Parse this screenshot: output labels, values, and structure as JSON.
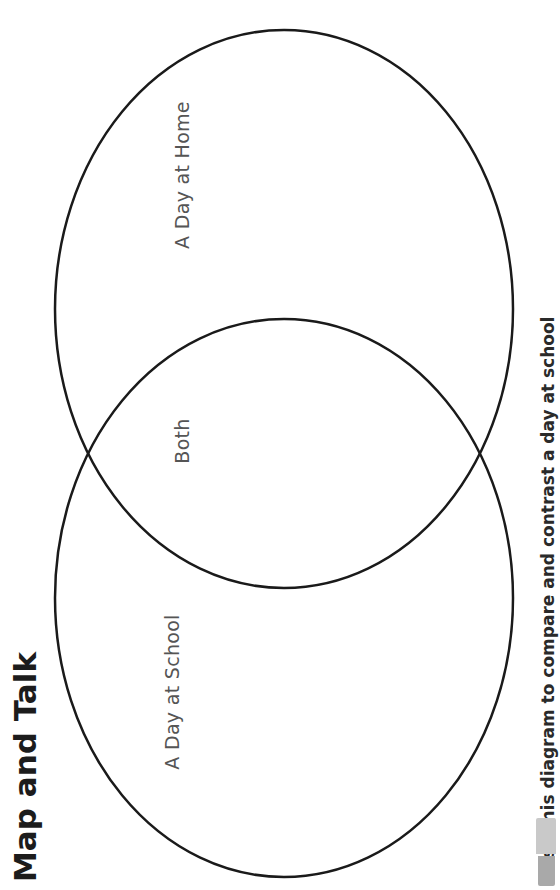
{
  "page": {
    "title": "Map and Talk",
    "instruction": "Use this diagram to compare and contrast a day at school",
    "instruction_icon": "marker-icon"
  },
  "venn": {
    "circles": [
      {
        "id": "home",
        "label": "A Day at Home",
        "cx": 284,
        "cy": 309,
        "rx": 229,
        "ry": 279
      },
      {
        "id": "school",
        "label": "A Day at School",
        "cx": 284,
        "cy": 598,
        "rx": 229,
        "ry": 279
      }
    ],
    "overlap_label": "Both",
    "stroke_color": "#1a1a1a",
    "stroke_width": 2.5
  },
  "colors": {
    "background": "#ffffff",
    "title": "#1c1c1c",
    "label": "#555555",
    "instruction": "#2a2a2a",
    "icon_light": "#c9c9c9",
    "icon_dark": "#a9a9a9"
  }
}
